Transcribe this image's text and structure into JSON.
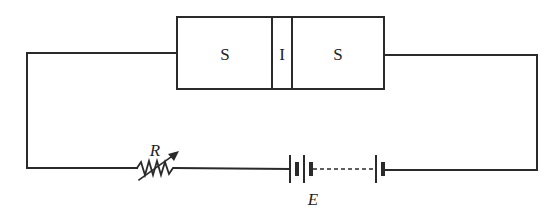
{
  "diagram": {
    "type": "circuit",
    "junction": {
      "left_label": "S",
      "middle_label": "I",
      "right_label": "S",
      "description": "Superconductor-Insulator-Superconductor junction"
    },
    "resistor": {
      "label": "R",
      "variable": true
    },
    "battery": {
      "label": "E",
      "cells": "multiple (dashed series)"
    },
    "colors": {
      "line": "#2a2a2a",
      "background": "#ffffff"
    }
  }
}
